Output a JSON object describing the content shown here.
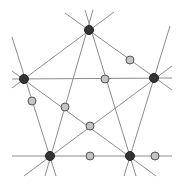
{
  "diagram": {
    "width": 180,
    "height": 184,
    "background": "#ffffff",
    "line_color": "#8c8c8c",
    "line_width": 1,
    "dark_node": {
      "fill": "#333333",
      "stroke": "#222222",
      "radius": 4.5
    },
    "light_node": {
      "fill": "#c4c4c4",
      "stroke": "#555555",
      "radius": 4
    },
    "lines": [
      {
        "id": "h-top",
        "x1": 12,
        "y1": 79,
        "x2": 172,
        "y2": 78
      },
      {
        "id": "h-bottom",
        "x1": 12,
        "y1": 156,
        "x2": 172,
        "y2": 156
      },
      {
        "id": "T-L",
        "x1": 12,
        "y1": 88,
        "x2": 114,
        "y2": 12
      },
      {
        "id": "T-R",
        "x1": 65,
        "y1": 13,
        "x2": 172,
        "y2": 90
      },
      {
        "id": "T-BL",
        "x1": 93,
        "y1": 10,
        "x2": 45,
        "y2": 176
      },
      {
        "id": "T-BR",
        "x1": 85,
        "y1": 10,
        "x2": 136,
        "y2": 176
      },
      {
        "id": "L-BL",
        "x1": 12,
        "y1": 37,
        "x2": 56,
        "y2": 176
      },
      {
        "id": "R-BR",
        "x1": 170,
        "y1": 26,
        "x2": 124,
        "y2": 176
      },
      {
        "id": "L-BR",
        "x1": 12,
        "y1": 71,
        "x2": 156,
        "y2": 176
      },
      {
        "id": "R-BL",
        "x1": 172,
        "y1": 66,
        "x2": 24,
        "y2": 176
      }
    ],
    "dark_nodes": [
      {
        "id": "T",
        "cx": 89,
        "cy": 30
      },
      {
        "id": "L",
        "cx": 24,
        "cy": 79
      },
      {
        "id": "R",
        "cx": 154,
        "cy": 78
      },
      {
        "id": "BL",
        "cx": 50,
        "cy": 156
      },
      {
        "id": "BR",
        "cx": 130,
        "cy": 156
      }
    ],
    "light_nodes": [
      {
        "id": "p1",
        "cx": 130,
        "cy": 60
      },
      {
        "id": "p2",
        "cx": 105,
        "cy": 79
      },
      {
        "id": "p3",
        "cx": 32,
        "cy": 101
      },
      {
        "id": "p4",
        "cx": 65,
        "cy": 107
      },
      {
        "id": "p5",
        "cx": 90,
        "cy": 126
      },
      {
        "id": "p6",
        "cx": 90,
        "cy": 156
      },
      {
        "id": "p7",
        "cx": 155,
        "cy": 156
      }
    ]
  }
}
